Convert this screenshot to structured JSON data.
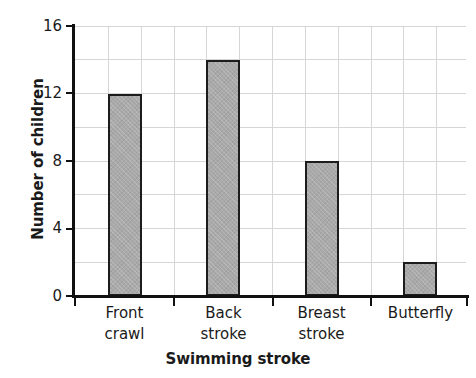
{
  "chart_data": {
    "type": "bar",
    "title": "",
    "xlabel": "Swimming stroke",
    "ylabel": "Number of children",
    "categories": [
      "Front crawl",
      "Back stroke",
      "Breast stroke",
      "Butterfly"
    ],
    "category_lines": [
      [
        "Front",
        "crawl"
      ],
      [
        "Back",
        "stroke"
      ],
      [
        "Breast",
        "stroke"
      ],
      [
        "Butterfly"
      ]
    ],
    "values": [
      12,
      14,
      8,
      2
    ],
    "ylim": [
      0,
      16
    ],
    "y_major_ticks": [
      0,
      4,
      8,
      12,
      16
    ],
    "y_major_tick_labels": [
      "0",
      "4",
      "8",
      "12",
      "16"
    ],
    "y_minor_gridlines": [
      2,
      6,
      10,
      14
    ],
    "y_gridline_step": 2,
    "x_vertical_gridline_count": 11,
    "grid": true,
    "legend": "none",
    "bar_fill_color": "#a9a9a9",
    "bar_edge_color": "#1c1c1c",
    "gridline_color": "#d6d6d6",
    "axis_color": "#111111",
    "background_color": "#ffffff"
  }
}
